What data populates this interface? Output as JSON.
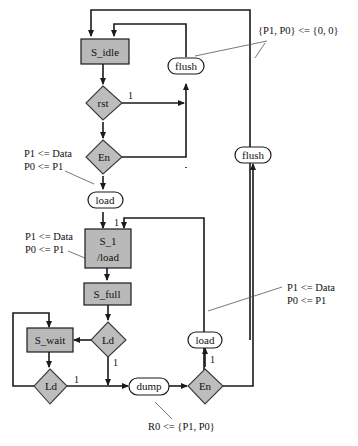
{
  "states": {
    "s_idle": "S_idle",
    "s_1_line1": "S_1",
    "s_1_line2": "/load",
    "s_full": "S_full",
    "s_wait": "S_wait"
  },
  "decisions": {
    "rst": "rst",
    "en_top": "En",
    "ld_right": "Ld",
    "ld_left": "Ld",
    "en_bottom": "En"
  },
  "outputs": {
    "flush_top": "flush",
    "flush_right": "flush",
    "load_top": "load",
    "load_bottom": "load",
    "dump": "dump"
  },
  "edge_labels": {
    "rst_true": "1",
    "s1_entry": "1",
    "ld_right_true": "1",
    "ld_left_true": "1",
    "en_bottom_true": "1"
  },
  "annotations": {
    "flush_assign": "{P1, P0} <= {0, 0}",
    "load_top_line1": "P1 <= Data",
    "load_top_line2": "P0 <= P1",
    "s1_line1": "P1 <= Data",
    "s1_line2": "P0 <= P1",
    "load_bottom_line1": "P1 <= Data",
    "load_bottom_line2": "P0 <= P1",
    "dump_assign": "R0 <= {P1, P0}"
  }
}
